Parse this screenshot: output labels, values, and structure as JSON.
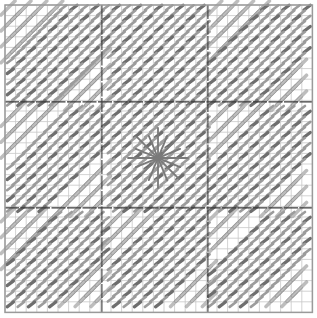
{
  "diagram": {
    "type": "needlepoint-stitch-chart",
    "width": 317,
    "height": 318,
    "grid": {
      "origin_x": 5,
      "origin_y": 5,
      "cells": 29,
      "cell_size": 10.6,
      "major_every": [
        9,
        19
      ],
      "minor_line_color": "#c8c8c8",
      "major_line_color": "#3a3a3a",
      "border_color": "#9a9a9a"
    },
    "colors": {
      "dark_stitch": "#6e6e6e",
      "medium_stitch": "#9c9c9c",
      "light_stitch": "#bdbdbd",
      "light_stitch_outline": "#8a8a8a",
      "star": "#7a7a7a",
      "background": "#ffffff"
    },
    "blocks": [
      {
        "row": 0,
        "col": 0,
        "long_band": "top-left"
      },
      {
        "row": 0,
        "col": 1,
        "long_band": "none"
      },
      {
        "row": 0,
        "col": 2,
        "long_band": "top-right"
      },
      {
        "row": 1,
        "col": 0,
        "long_band": "left"
      },
      {
        "row": 1,
        "col": 1,
        "long_band": "center"
      },
      {
        "row": 1,
        "col": 2,
        "long_band": "right"
      },
      {
        "row": 2,
        "col": 0,
        "long_band": "bottom-left"
      },
      {
        "row": 2,
        "col": 1,
        "long_band": "bottom"
      },
      {
        "row": 2,
        "col": 2,
        "long_band": "bottom-right"
      }
    ],
    "center_motif": {
      "type": "star",
      "cx": 158,
      "cy": 158,
      "radius": 30,
      "rays": 8
    }
  }
}
